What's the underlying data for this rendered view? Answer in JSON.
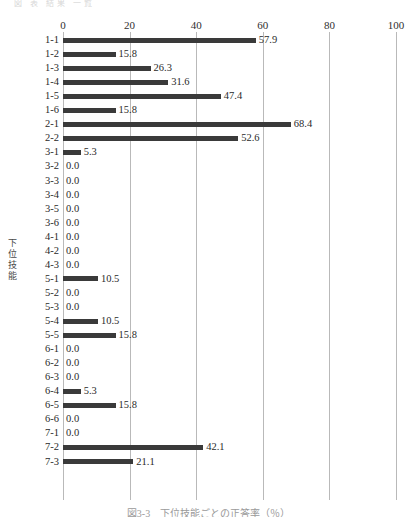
{
  "figure": {
    "top_clip_text": "図 表 結果 一覧",
    "caption": "図3-3　下位技能ごとの正答率（％）"
  },
  "chart_data": {
    "type": "bar",
    "orientation": "horizontal",
    "title": "",
    "xlabel": "",
    "ylabel": "下位技能",
    "xlim": [
      0,
      100
    ],
    "xticks": [
      "0",
      "20",
      "40",
      "60",
      "80",
      "100"
    ],
    "xtick_values": [
      0,
      20,
      40,
      60,
      80,
      100
    ],
    "grid": "vertical-only",
    "legend": "none",
    "bar_color": "#3a3a3a",
    "gridline_color": "#b9b9b9",
    "categories": [
      "1-1",
      "1-2",
      "1-3",
      "1-4",
      "1-5",
      "1-6",
      "2-1",
      "2-2",
      "3-1",
      "3-2",
      "3-3",
      "3-4",
      "3-5",
      "3-6",
      "4-1",
      "4-2",
      "4-3",
      "5-1",
      "5-2",
      "5-3",
      "5-4",
      "5-5",
      "6-1",
      "6-2",
      "6-3",
      "6-4",
      "6-5",
      "6-6",
      "7-1",
      "7-2",
      "7-3"
    ],
    "values": [
      57.9,
      15.8,
      26.3,
      31.6,
      47.4,
      15.8,
      68.4,
      52.6,
      5.3,
      0.0,
      0.0,
      0.0,
      0.0,
      0.0,
      0.0,
      0.0,
      0.0,
      10.5,
      0.0,
      0.0,
      10.5,
      15.8,
      0.0,
      0.0,
      0.0,
      5.3,
      15.8,
      0.0,
      0.0,
      42.1,
      21.1
    ],
    "value_labels": [
      "57.9",
      "15.8",
      "26.3",
      "31.6",
      "47.4",
      "15.8",
      "68.4",
      "52.6",
      "5.3",
      "0.0",
      "0.0",
      "0.0",
      "0.0",
      "0.0",
      "0.0",
      "0.0",
      "0.0",
      "10.5",
      "0.0",
      "0.0",
      "10.5",
      "15.8",
      "0.0",
      "0.0",
      "0.0",
      "5.3",
      "15.8",
      "0.0",
      "0.0",
      "42.1",
      "21.1"
    ]
  }
}
